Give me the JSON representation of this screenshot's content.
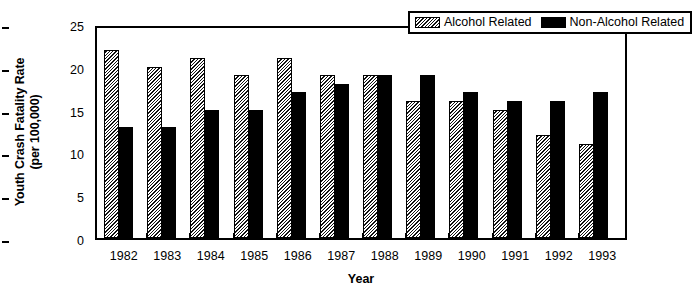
{
  "chart_data": {
    "type": "bar",
    "title": "",
    "xlabel": "Year",
    "ylabel_line1": "Youth Crash Fatality Rate",
    "ylabel_line2": "(per 100,000)",
    "categories": [
      "1982",
      "1983",
      "1984",
      "1985",
      "1986",
      "1987",
      "1988",
      "1989",
      "1990",
      "1991",
      "1992",
      "1993"
    ],
    "series": [
      {
        "name": "Alcohol Related",
        "values": [
          22,
          20,
          21,
          19,
          21,
          19,
          19,
          16,
          16,
          15,
          12,
          11
        ],
        "fill": "diagonal-hatch",
        "color": "#ffffff"
      },
      {
        "name": "Non-Alcohol Related",
        "values": [
          13,
          13,
          15,
          15,
          17,
          18,
          19,
          19,
          17,
          16,
          16,
          17
        ],
        "fill": "solid",
        "color": "#000000"
      }
    ],
    "ylim": [
      0,
      25
    ],
    "yticks": [
      0,
      5,
      10,
      15,
      20,
      25
    ],
    "ytick_labels": [
      "0",
      "5",
      "10",
      "15",
      "20",
      "25"
    ],
    "grid": false,
    "legend_position": "top-right",
    "axis_color": "#000000",
    "background": "#ffffff"
  },
  "legend": {
    "entries": [
      {
        "label": "Alcohol Related"
      },
      {
        "label": "Non-Alcohol Related"
      }
    ]
  }
}
